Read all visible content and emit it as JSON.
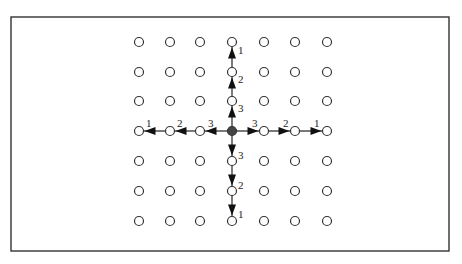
{
  "diagram": {
    "type": "grid-neighborhood",
    "grid": {
      "cols": 7,
      "rows": 7,
      "x": [
        139,
        170,
        200,
        232,
        264,
        295,
        327
      ],
      "y": [
        42,
        72,
        101,
        131,
        161,
        191,
        221
      ],
      "node_radius": 4.5,
      "center": {
        "col": 3,
        "row": 3,
        "filled": true
      }
    },
    "arrows": {
      "up": [
        {
          "label": "3",
          "from": [
            3,
            3
          ],
          "to": [
            3,
            2
          ]
        },
        {
          "label": "2",
          "from": [
            3,
            2
          ],
          "to": [
            3,
            1
          ]
        },
        {
          "label": "1",
          "from": [
            3,
            1
          ],
          "to": [
            3,
            0
          ]
        }
      ],
      "down": [
        {
          "label": "3",
          "from": [
            3,
            3
          ],
          "to": [
            3,
            4
          ]
        },
        {
          "label": "2",
          "from": [
            3,
            4
          ],
          "to": [
            3,
            5
          ]
        },
        {
          "label": "1",
          "from": [
            3,
            5
          ],
          "to": [
            3,
            6
          ]
        }
      ],
      "left": [
        {
          "label": "3",
          "from": [
            3,
            3
          ],
          "to": [
            2,
            3
          ]
        },
        {
          "label": "2",
          "from": [
            2,
            3
          ],
          "to": [
            1,
            3
          ]
        },
        {
          "label": "1",
          "from": [
            1,
            3
          ],
          "to": [
            0,
            3
          ]
        }
      ],
      "right": [
        {
          "label": "3",
          "from": [
            3,
            3
          ],
          "to": [
            4,
            3
          ]
        },
        {
          "label": "2",
          "from": [
            4,
            3
          ],
          "to": [
            5,
            3
          ]
        },
        {
          "label": "1",
          "from": [
            5,
            3
          ],
          "to": [
            6,
            3
          ]
        }
      ]
    },
    "labels": {
      "up": [
        "3",
        "2",
        "1"
      ],
      "down": [
        "3",
        "2",
        "1"
      ],
      "left": [
        "3",
        "2",
        "1"
      ],
      "right": [
        "3",
        "2",
        "1"
      ]
    },
    "colors": {
      "stroke": "#333333",
      "center_fill": "#444444",
      "background": "#ffffff"
    }
  }
}
